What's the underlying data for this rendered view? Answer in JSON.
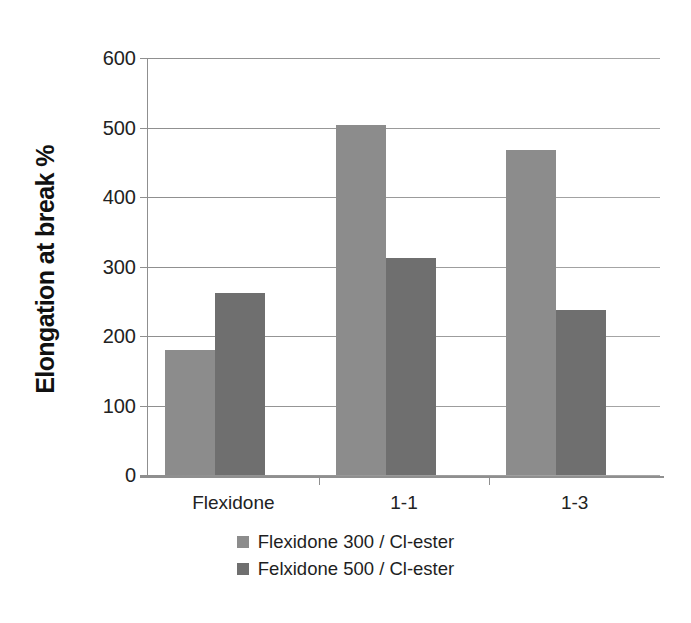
{
  "chart_data": {
    "type": "bar",
    "title": "",
    "xlabel": "",
    "ylabel": "Elongation at break %",
    "categories": [
      "Flexidone",
      "1-1",
      "1-3"
    ],
    "series": [
      {
        "name": "Flexidone 300 / Cl-ester",
        "color": "#8c8c8c",
        "values": [
          180,
          503,
          467
        ]
      },
      {
        "name": "Felxidone 500 / Cl-ester",
        "color": "#6f6f6f",
        "values": [
          262,
          312,
          238
        ]
      }
    ],
    "ylim": [
      0,
      600
    ],
    "yticks": [
      0,
      100,
      200,
      300,
      400,
      500,
      600
    ],
    "ytick_labels": [
      "0",
      "100",
      "200",
      "300",
      "400",
      "500",
      "600"
    ],
    "grid": true,
    "legend_position": "bottom"
  },
  "axis": {
    "y_title": "Elongation at break %"
  },
  "legend": {
    "items": [
      {
        "label": "Flexidone 300 / Cl-ester",
        "color": "#8c8c8c"
      },
      {
        "label": "Felxidone 500 / Cl-ester",
        "color": "#6f6f6f"
      }
    ]
  },
  "page": {
    "bottom_artifact": ""
  }
}
